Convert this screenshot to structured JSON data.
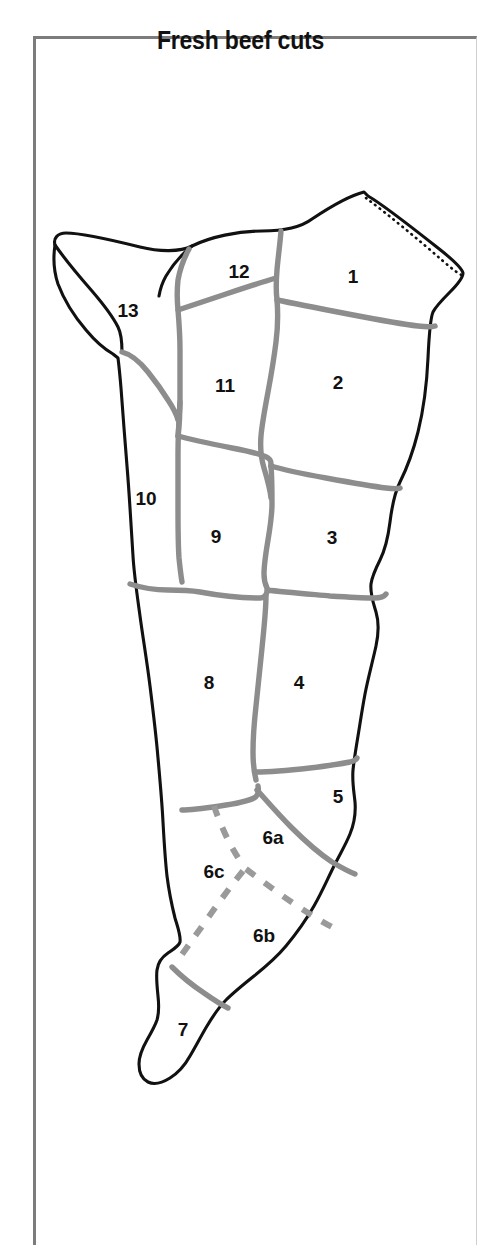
{
  "page": {
    "title": "Fresh beef cuts",
    "background_color": "#ffffff",
    "frame_color": "#7c7c7c",
    "outline_color": "#111111",
    "divider_color": "#8d8d8d",
    "dashed_divider_color": "#9a9a9a"
  },
  "diagram": {
    "name": "beef-carcass-cuts-diagram",
    "label_count": 15,
    "labels": [
      {
        "id": "cut-1",
        "text": "1",
        "x": 353,
        "y": 278
      },
      {
        "id": "cut-2",
        "text": "2",
        "x": 338,
        "y": 384
      },
      {
        "id": "cut-3",
        "text": "3",
        "x": 332,
        "y": 539
      },
      {
        "id": "cut-4",
        "text": "4",
        "x": 299,
        "y": 684
      },
      {
        "id": "cut-5",
        "text": "5",
        "x": 338,
        "y": 798
      },
      {
        "id": "cut-6a",
        "text": "6a",
        "x": 273,
        "y": 839
      },
      {
        "id": "cut-6b",
        "text": "6b",
        "x": 264,
        "y": 937
      },
      {
        "id": "cut-6c",
        "text": "6c",
        "x": 214,
        "y": 873
      },
      {
        "id": "cut-7",
        "text": "7",
        "x": 183,
        "y": 1031
      },
      {
        "id": "cut-8",
        "text": "8",
        "x": 209,
        "y": 684
      },
      {
        "id": "cut-9",
        "text": "9",
        "x": 216,
        "y": 538
      },
      {
        "id": "cut-10",
        "text": "10",
        "x": 146,
        "y": 500
      },
      {
        "id": "cut-11",
        "text": "11",
        "x": 225,
        "y": 387
      },
      {
        "id": "cut-12",
        "text": "12",
        "x": 239,
        "y": 273
      },
      {
        "id": "cut-13",
        "text": "13",
        "x": 128,
        "y": 312
      }
    ]
  }
}
